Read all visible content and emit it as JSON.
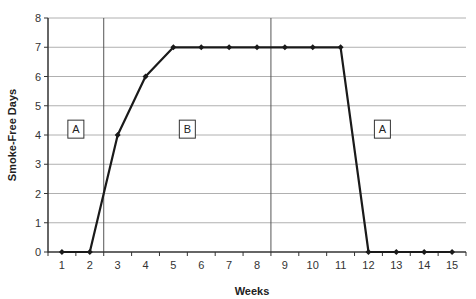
{
  "chart_data": {
    "type": "line",
    "title": "",
    "xlabel": "Weeks",
    "ylabel": "Smoke-Free Days",
    "x": [
      1,
      2,
      3,
      4,
      5,
      6,
      7,
      8,
      9,
      10,
      11,
      12,
      13,
      14,
      15
    ],
    "series": [
      {
        "name": "Smoke-Free Days",
        "values": [
          0,
          0,
          4,
          6,
          7,
          7,
          7,
          7,
          7,
          7,
          7,
          0,
          0,
          0,
          0
        ]
      }
    ],
    "xticks": [
      "1",
      "2",
      "3",
      "4",
      "5",
      "6",
      "7",
      "8",
      "9",
      "10",
      "11",
      "12",
      "13",
      "14",
      "15"
    ],
    "yticks": [
      "0",
      "1",
      "2",
      "3",
      "4",
      "5",
      "6",
      "7",
      "8"
    ],
    "ylim": [
      0,
      8
    ],
    "xlim": [
      0.5,
      15.5
    ],
    "grid": {
      "horizontal": true,
      "vertical": false
    },
    "legend": null,
    "phase_lines": [
      2.5,
      8.5
    ],
    "phases": [
      {
        "label": "A",
        "x": 1.5,
        "y": 4.2
      },
      {
        "label": "B",
        "x": 5.5,
        "y": 4.2
      },
      {
        "label": "A",
        "x": 12.5,
        "y": 4.2
      }
    ],
    "colors": {
      "line": "#1a1a1a",
      "grid": "#b0b0b0",
      "axis": "#333333",
      "phase_line": "#555555"
    }
  }
}
